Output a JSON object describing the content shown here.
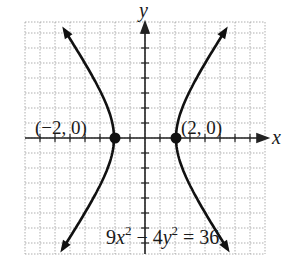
{
  "graph": {
    "x_axis_label": "x",
    "y_axis_label": "y",
    "vertex_left_label": "(−2, 0)",
    "vertex_right_label": "(2, 0)",
    "equation": {
      "coef_x": "9",
      "var_x": "x",
      "exp_x": "2",
      "minus": " − 4",
      "var_y": "y",
      "exp_y": "2",
      "rhs": " = 36"
    },
    "colors": {
      "curve": "#111111",
      "grid": "#9a9a9a",
      "axis": "#222222"
    }
  },
  "chart_data": {
    "type": "line",
    "title": "",
    "equation": "9x^2 - 4y^2 = 36",
    "curve": "hyperbola",
    "vertices": [
      [
        -2,
        0
      ],
      [
        2,
        0
      ]
    ],
    "xlabel": "x",
    "ylabel": "y",
    "xlim": [
      -8,
      8
    ],
    "ylim": [
      -8,
      8
    ],
    "grid": true,
    "annotations": [
      "(-2, 0)",
      "(2, 0)",
      "9x^2 - 4y^2 = 36"
    ]
  }
}
